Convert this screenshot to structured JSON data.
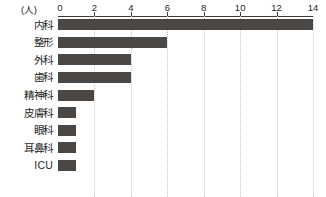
{
  "chart_data": {
    "type": "bar",
    "orientation": "horizontal",
    "title": "",
    "subtitle": "",
    "xlabel": "(人)",
    "ylabel": "",
    "unit_label": "(人)",
    "categories": [
      "内科",
      "整形",
      "外科",
      "歯科",
      "精神科",
      "皮膚科",
      "眼科",
      "耳鼻科",
      "ICU"
    ],
    "values": [
      14,
      6,
      4,
      4,
      2,
      1,
      1,
      1,
      1
    ],
    "xlim": [
      0,
      14
    ],
    "xticks": [
      0,
      2,
      4,
      6,
      8,
      10,
      12,
      14
    ],
    "xtick_labels": [
      "0",
      "2",
      "4",
      "6",
      "8",
      "10",
      "12",
      "14"
    ],
    "grid": true,
    "grid_axis": "x",
    "grid_style": "dotted",
    "legend": false,
    "legend_position": "none",
    "bar_color": "#4a4745",
    "grid_color": "#c9c6c3",
    "axis_color": "#3d3a38",
    "text_color": "#231f1d",
    "background_color": "#ffffff"
  }
}
